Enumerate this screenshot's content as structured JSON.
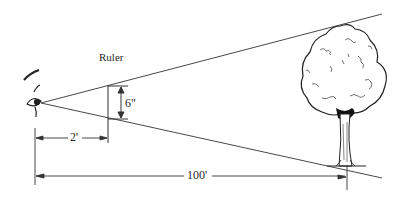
{
  "diagram": {
    "type": "similar-triangles sighting measurement",
    "labels": {
      "ruler": "Ruler",
      "ruler_height": "6\"",
      "eye_to_ruler": "2'",
      "eye_to_tree": "100'"
    },
    "elements": [
      "eye",
      "ruler",
      "tree",
      "upper-sight-line",
      "lower-sight-line"
    ],
    "colors": {
      "line": "#333333",
      "background": "#ffffff"
    }
  }
}
